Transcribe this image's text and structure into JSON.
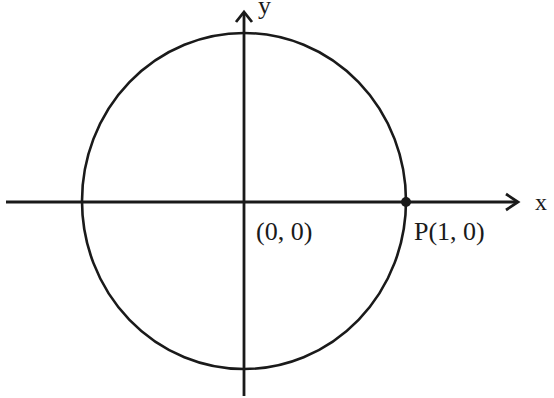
{
  "diagram": {
    "type": "unit-circle",
    "axes": {
      "x_label": "x",
      "y_label": "y"
    },
    "origin_label": "(0, 0)",
    "point": {
      "label": "P(1, 0)",
      "x": 1,
      "y": 0
    },
    "circle": {
      "center": [
        0,
        0
      ],
      "radius": 1
    },
    "colors": {
      "ink": "#1a1a1a",
      "background": "#ffffff"
    }
  }
}
